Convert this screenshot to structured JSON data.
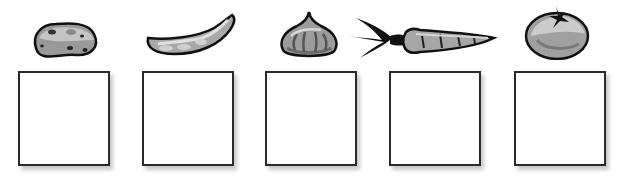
{
  "worksheet": {
    "items": [
      {
        "name": "potato",
        "icon": "potato-icon",
        "answer": ""
      },
      {
        "name": "pea pod",
        "icon": "pea-pod-icon",
        "answer": ""
      },
      {
        "name": "onion",
        "icon": "onion-icon",
        "answer": ""
      },
      {
        "name": "carrot",
        "icon": "carrot-icon",
        "answer": ""
      },
      {
        "name": "tomato",
        "icon": "tomato-icon",
        "answer": ""
      }
    ],
    "colors": {
      "outline": "#111111",
      "box_border": "#2a2a2a",
      "fill_light": "#bdbdbd",
      "fill_dark": "#7a7a7a"
    }
  }
}
